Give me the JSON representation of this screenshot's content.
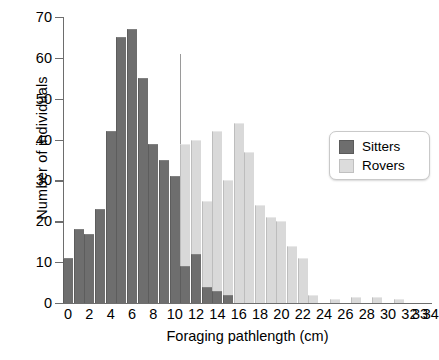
{
  "chart_data": {
    "type": "bar",
    "title": "",
    "subtitle": "",
    "xlabel": "Foraging pathlength (cm)",
    "ylabel": "Number of individuals",
    "xlim": [
      0,
      34.5
    ],
    "ylim": [
      0,
      70
    ],
    "grid": false,
    "legend_position": "right",
    "xtick_labels": [
      "0",
      "2",
      "4",
      "6",
      "8",
      "10",
      "12",
      "14",
      "16",
      "18",
      "20",
      "22",
      "24",
      "26",
      "28",
      "30",
      "32",
      "33",
      "34"
    ],
    "xtick_values": [
      0,
      2,
      4,
      6,
      8,
      10,
      12,
      14,
      16,
      18,
      20,
      22,
      24,
      26,
      28,
      30,
      32,
      33,
      34
    ],
    "ytick_labels": [
      "0",
      "10",
      "20",
      "30",
      "40",
      "50",
      "60",
      "70"
    ],
    "ytick_values": [
      0,
      10,
      20,
      30,
      40,
      50,
      60,
      70
    ],
    "bin_width": 0.95,
    "legend": [
      {
        "name": "Sitters",
        "color": "#6e6e6e"
      },
      {
        "name": "Rovers",
        "color": "#d9d9d9"
      }
    ],
    "series": [
      {
        "name": "Sitters",
        "color": "#6e6e6e",
        "x": [
          0,
          1,
          2,
          3,
          4,
          5,
          6,
          7,
          8,
          9,
          10,
          11,
          12,
          13,
          14,
          15,
          16,
          17
        ],
        "values": [
          11,
          18,
          17,
          23,
          42,
          65,
          67,
          55,
          39,
          35,
          31,
          9,
          12,
          4,
          3,
          2,
          0,
          0
        ]
      },
      {
        "name": "Rovers",
        "color": "#d9d9d9",
        "x": [
          0,
          1,
          2,
          3,
          4,
          5,
          6,
          7,
          8,
          9,
          10,
          11,
          12,
          13,
          14,
          15,
          16,
          17,
          18,
          19,
          20,
          21,
          22,
          23,
          24,
          25,
          26,
          27,
          28,
          29,
          30,
          31,
          32,
          33,
          34
        ],
        "values": [
          0,
          0,
          1,
          0,
          1,
          0,
          1,
          3,
          3,
          9,
          20,
          39,
          40,
          25,
          42,
          30,
          44,
          37,
          24,
          21,
          20,
          14,
          11,
          2,
          0,
          1,
          0,
          1.5,
          0,
          1.5,
          0,
          1,
          0,
          0,
          0
        ]
      }
    ]
  },
  "legend_box": {
    "sitters_label": "Sitters",
    "rovers_label": "Rovers"
  },
  "axes": {
    "x_title": "Foraging pathlength (cm)",
    "y_title": "Number of individuals"
  }
}
